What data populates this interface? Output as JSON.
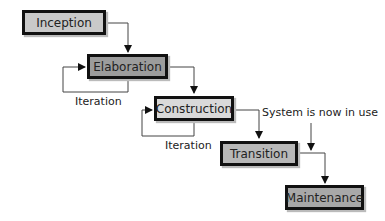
{
  "diagram": {
    "type": "waterfall-process",
    "phases": [
      {
        "id": "inception",
        "label": "Inception",
        "fill": "#c9c9c9"
      },
      {
        "id": "elaboration",
        "label": "Elaboration",
        "fill": "#9c9c9c"
      },
      {
        "id": "construction",
        "label": "Construction",
        "fill": "#d9d9d9"
      },
      {
        "id": "transition",
        "label": "Transition",
        "fill": "#b8b8b8"
      },
      {
        "id": "maintenance",
        "label": "Maintenance",
        "fill": "#a8a8a8"
      }
    ],
    "loops": [
      {
        "phase": "elaboration",
        "label": "Iteration"
      },
      {
        "phase": "construction",
        "label": "Iteration"
      }
    ],
    "annotation": "System is now in use",
    "edges": [
      [
        "inception",
        "elaboration"
      ],
      [
        "elaboration",
        "construction"
      ],
      [
        "construction",
        "transition"
      ],
      [
        "transition",
        "maintenance"
      ]
    ]
  }
}
